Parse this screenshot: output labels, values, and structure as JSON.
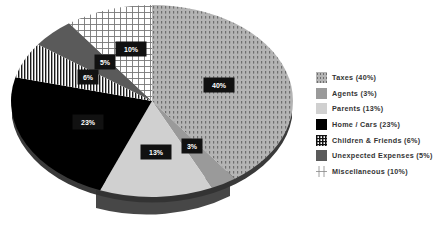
{
  "chart_data": {
    "type": "pie",
    "title": "",
    "style": "3d-pie-patterned-grayscale",
    "categories": [
      "Taxes",
      "Agents",
      "Parents",
      "Home / Cars",
      "Children & Friends",
      "Unexpected Expenses",
      "Miscellaneous"
    ],
    "values": [
      40,
      3,
      13,
      23,
      6,
      5,
      10
    ],
    "unit": "%",
    "data_labels": [
      "40%",
      "3%",
      "13%",
      "23%",
      "6%",
      "5%",
      "10%"
    ],
    "legend": {
      "position": "right",
      "entries": [
        "Taxes (40%)",
        "Agents (3%)",
        "Parents (13%)",
        "Home / Cars (23%)",
        "Children & Friends (6%)",
        "Unexpected Expenses (5%)",
        "Miscellaneous (10%)"
      ]
    },
    "start_angle_deg": 0,
    "direction": "clockwise",
    "grid": false
  },
  "slices": [
    {
      "name": "taxes",
      "label": "40%",
      "fill": "#a8a8a8",
      "pattern": "dots",
      "lx": 219,
      "ly": 85
    },
    {
      "name": "agents",
      "label": "3%",
      "fill": "#9a9a9a",
      "pattern": "none",
      "lx": 192,
      "ly": 146
    },
    {
      "name": "parents",
      "label": "13%",
      "fill": "#d0d0d0",
      "pattern": "none",
      "lx": 156,
      "ly": 152
    },
    {
      "name": "home-cars",
      "label": "23%",
      "fill": "#000000",
      "pattern": "none",
      "lx": 88,
      "ly": 122
    },
    {
      "name": "children-friends",
      "label": "6%",
      "fill": "#ffffff",
      "pattern": "vlines",
      "lx": 88,
      "ly": 77
    },
    {
      "name": "unexpected-expenses",
      "label": "5%",
      "fill": "#5a5a5a",
      "pattern": "none",
      "lx": 105,
      "ly": 62
    },
    {
      "name": "miscellaneous",
      "label": "10%",
      "fill": "#ffffff",
      "pattern": "grid",
      "lx": 131,
      "ly": 49
    }
  ],
  "legend_items": [
    {
      "label": "Taxes (40%)"
    },
    {
      "label": "Agents (3%)"
    },
    {
      "label": "Parents (13%)"
    },
    {
      "label": "Home / Cars (23%)"
    },
    {
      "label": "Children & Friends (6%)"
    },
    {
      "label": "Unexpected Expenses (5%)"
    },
    {
      "label": "Miscellaneous (10%)"
    }
  ]
}
